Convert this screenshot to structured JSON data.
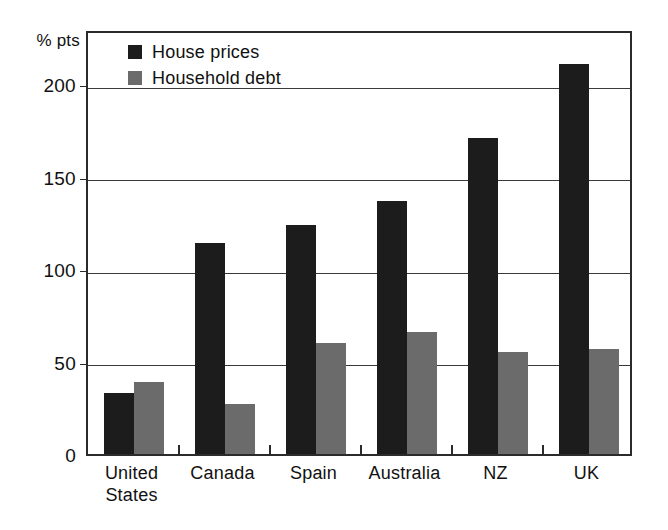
{
  "chart_data": {
    "type": "bar",
    "title": "",
    "subtitle": "",
    "xlabel": "",
    "ylabel": "% pts",
    "ylim": [
      0,
      230
    ],
    "yticks": [
      0,
      50,
      100,
      150,
      200
    ],
    "ytick_labels": [
      "0",
      "50",
      "100",
      "150",
      "200"
    ],
    "grid": true,
    "grid_axis": "y",
    "legend_position": "top-left-inside",
    "categories": [
      "United States",
      "Canada",
      "Spain",
      "Australia",
      "NZ",
      "UK"
    ],
    "category_label_lines": [
      [
        "United",
        "States"
      ],
      [
        "Canada"
      ],
      [
        "Spain"
      ],
      [
        "Australia"
      ],
      [
        "NZ"
      ],
      [
        "UK"
      ]
    ],
    "series": [
      {
        "name": "House prices",
        "color": "#1c1c1c",
        "values": [
          33,
          114,
          124,
          137,
          171,
          211
        ]
      },
      {
        "name": "Household debt",
        "color": "#6b6b6b",
        "values": [
          39,
          27,
          60,
          66,
          55,
          57
        ]
      }
    ]
  },
  "legend": {
    "items": [
      {
        "label": "House prices",
        "color": "#1c1c1c"
      },
      {
        "label": "Household debt",
        "color": "#6b6b6b"
      }
    ]
  },
  "axis": {
    "unit_label": "% pts",
    "y_ticks": [
      {
        "label": "200",
        "value": 200
      },
      {
        "label": "150",
        "value": 150
      },
      {
        "label": "100",
        "value": 100
      },
      {
        "label": "50",
        "value": 50
      },
      {
        "label": "0",
        "value": 0
      }
    ]
  },
  "categories": [
    {
      "line1": "United",
      "line2": "States"
    },
    {
      "line1": "Canada",
      "line2": ""
    },
    {
      "line1": "Spain",
      "line2": ""
    },
    {
      "line1": "Australia",
      "line2": ""
    },
    {
      "line1": "NZ",
      "line2": ""
    },
    {
      "line1": "UK",
      "line2": ""
    }
  ]
}
